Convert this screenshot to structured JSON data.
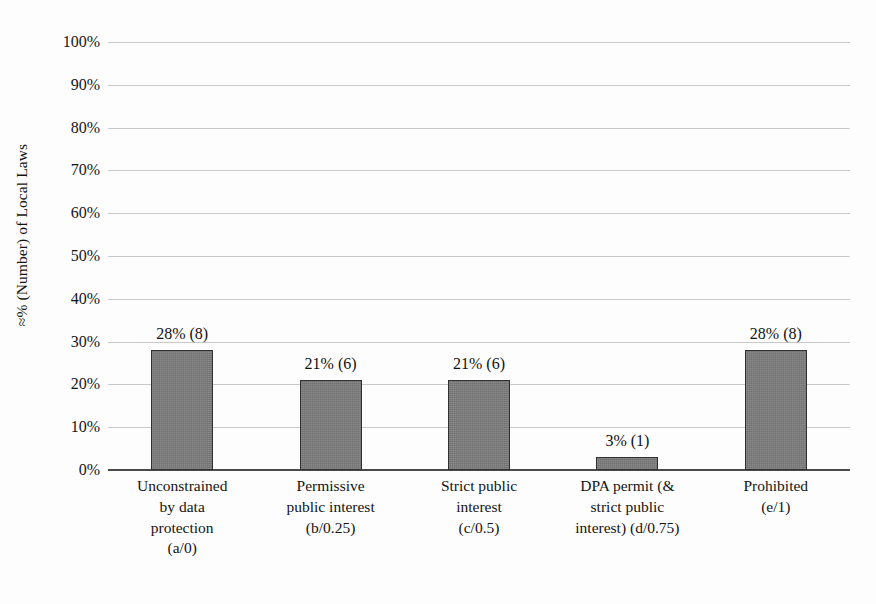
{
  "chart_data": {
    "type": "bar",
    "title": "",
    "subtitle": "",
    "xlabel": "",
    "ylabel": "≈% (Number) of Local Laws",
    "ylim": [
      0,
      100
    ],
    "ytick_labels": [
      "0%",
      "10%",
      "20%",
      "30%",
      "40%",
      "50%",
      "60%",
      "70%",
      "80%",
      "90%",
      "100%"
    ],
    "ytick_values": [
      0,
      10,
      20,
      30,
      40,
      50,
      60,
      70,
      80,
      90,
      100
    ],
    "grid": true,
    "legend": "none",
    "categories": [
      [
        "Unconstrained",
        "by data",
        "protection",
        "(a/0)"
      ],
      [
        "Permissive",
        "public interest",
        "(b/0.25)"
      ],
      [
        "Strict public",
        "interest",
        "(c/0.5)"
      ],
      [
        "DPA permit (&",
        "strict public",
        "interest) (d/0.75)"
      ],
      [
        "Prohibited",
        "(e/1)"
      ]
    ],
    "category_names": [
      "Unconstrained by data protection (a/0)",
      "Permissive public interest (b/0.25)",
      "Strict public interest (c/0.5)",
      "DPA permit (& strict public interest) (d/0.75)",
      "Prohibited (e/1)"
    ],
    "values": [
      28,
      21,
      21,
      3,
      28
    ],
    "counts": [
      8,
      6,
      6,
      1,
      8
    ],
    "data_labels": [
      "28% (8)",
      "21% (6)",
      "21% (6)",
      "3% (1)",
      "28% (8)"
    ],
    "bar_color": "#7d7d7d",
    "bar_edge_color": "#303030",
    "gridline_color": "#c9c9c9",
    "axis_color": "#4a4a4a",
    "background_color": "#fdfdfd"
  }
}
